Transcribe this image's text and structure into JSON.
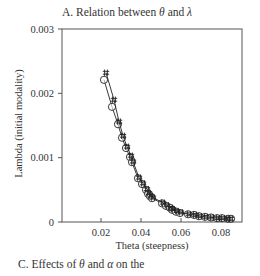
{
  "chart_data": {
    "type": "scatter",
    "title": "A. Relation between θ and λ",
    "title_parts": {
      "prefix": "A. Relation between ",
      "sym1": "θ",
      "mid": " and ",
      "sym2": "λ"
    },
    "xlabel": "Theta (steepness)",
    "ylabel": "Lambda (initial modality)",
    "xlim": [
      0,
      0.091
    ],
    "ylim": [
      0,
      0.003
    ],
    "xticks": [
      0.02,
      0.04,
      0.06,
      0.08
    ],
    "xtick_labels": [
      "0.02",
      "0.04",
      "0.06",
      "0.08"
    ],
    "yticks": [
      0,
      0.001,
      0.002,
      0.003
    ],
    "ytick_labels": [
      "0",
      "0.001",
      "0.002",
      "0.003"
    ],
    "grid": false,
    "legend": null,
    "series": [
      {
        "name": "circle markers",
        "marker": "circle",
        "x": [
          0.0215,
          0.0255,
          0.0285,
          0.0305,
          0.0325,
          0.0345,
          0.0355,
          0.0385,
          0.0405,
          0.0425,
          0.0435,
          0.0445,
          0.0455,
          0.0505,
          0.0525,
          0.0545,
          0.0555,
          0.0575,
          0.0595,
          0.0635,
          0.0665,
          0.069,
          0.072,
          0.075,
          0.078,
          0.0805,
          0.0835,
          0.085
        ],
        "y": [
          0.00221,
          0.00179,
          0.00152,
          0.00131,
          0.00115,
          0.00101,
          0.00093,
          0.00068,
          0.00059,
          0.0005,
          0.00044,
          0.0004,
          0.00037,
          0.00029,
          0.00025,
          0.00022,
          0.00019,
          0.00016,
          0.00014,
          0.00012,
          0.00011,
          9e-05,
          8e-05,
          7e-05,
          6e-05,
          6e-05,
          5e-05,
          5e-05
        ]
      },
      {
        "name": "hash markers",
        "marker": "hash",
        "x": [
          0.0225,
          0.0265,
          0.029,
          0.031,
          0.033,
          0.035,
          0.036,
          0.039,
          0.041,
          0.043,
          0.044,
          0.045,
          0.046,
          0.051,
          0.053,
          0.055,
          0.056,
          0.058,
          0.06,
          0.064,
          0.067,
          0.0695,
          0.0725,
          0.0755,
          0.0785,
          0.081,
          0.0835,
          0.085
        ],
        "y": [
          0.00232,
          0.0019,
          0.00156,
          0.00134,
          0.00117,
          0.00103,
          0.00094,
          0.00069,
          0.0006,
          0.00051,
          0.00045,
          0.00041,
          0.00038,
          0.0003,
          0.00026,
          0.00022,
          0.0002,
          0.00017,
          0.00015,
          0.00012,
          0.00011,
          9e-05,
          8e-05,
          7e-05,
          6e-05,
          6e-05,
          5e-05,
          5e-05
        ]
      }
    ]
  },
  "caption": {
    "prefix": "C. Effects of ",
    "sym1": "θ",
    "mid": " and ",
    "sym2": "α",
    "suffix": " on the"
  },
  "colors": {
    "axis": "#555555",
    "marker": "#222222",
    "text": "#333333"
  }
}
